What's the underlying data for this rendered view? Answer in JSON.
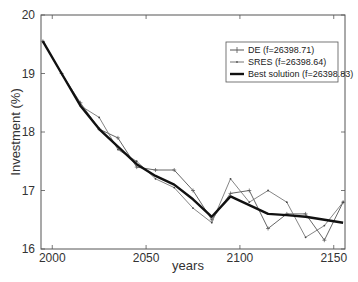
{
  "chart_data": {
    "type": "line",
    "title": "",
    "xlabel": "years",
    "ylabel": "Investment (%)",
    "xlim": [
      1994,
      2156
    ],
    "ylim": [
      16,
      20
    ],
    "xticks": [
      2000,
      2050,
      2100,
      2150
    ],
    "yticks": [
      16,
      17,
      18,
      19,
      20
    ],
    "grid": false,
    "legend_position": "upper right",
    "series": [
      {
        "name": "DE (f=26398.71)",
        "style": "thin line with + markers",
        "color": "#555555",
        "x": [
          1995,
          2005,
          2015,
          2025,
          2035,
          2045,
          2055,
          2065,
          2075,
          2085,
          2095,
          2105,
          2115,
          2125,
          2135,
          2145,
          2155
        ],
        "values": [
          19.55,
          19.0,
          18.5,
          18.05,
          17.9,
          17.4,
          17.35,
          17.35,
          17.0,
          16.5,
          16.95,
          17.0,
          16.35,
          16.6,
          16.6,
          16.15,
          16.8
        ]
      },
      {
        "name": "SRES (f=26398.64)",
        "style": "thin line with small markers",
        "color": "#777777",
        "x": [
          1995,
          2005,
          2015,
          2025,
          2035,
          2045,
          2055,
          2065,
          2075,
          2085,
          2095,
          2105,
          2115,
          2125,
          2135,
          2145,
          2155
        ],
        "values": [
          19.55,
          19.0,
          18.45,
          18.25,
          17.7,
          17.5,
          17.2,
          17.05,
          16.7,
          16.45,
          17.2,
          16.8,
          17.0,
          16.8,
          16.2,
          16.4,
          16.8
        ]
      },
      {
        "name": "Best solution (f=26398.83)",
        "style": "thick solid line",
        "color": "#111111",
        "x": [
          1995,
          2005,
          2015,
          2025,
          2035,
          2045,
          2055,
          2065,
          2075,
          2085,
          2095,
          2105,
          2115,
          2125,
          2135,
          2145,
          2155
        ],
        "values": [
          19.55,
          19.0,
          18.45,
          18.05,
          17.75,
          17.45,
          17.25,
          17.1,
          16.85,
          16.55,
          16.9,
          16.75,
          16.6,
          16.58,
          16.55,
          16.5,
          16.45
        ]
      }
    ]
  },
  "legend": {
    "items": [
      {
        "label": "DE (f=26398.71)"
      },
      {
        "label": "SRES (f=26398.64)"
      },
      {
        "label": "Best solution (f=26398.83)"
      }
    ]
  },
  "axes": {
    "xlabel": "years",
    "ylabel": "Investment (%)",
    "xtick_labels": [
      "2000",
      "2050",
      "2100",
      "2150"
    ],
    "ytick_labels": [
      "16",
      "17",
      "18",
      "19",
      "20"
    ]
  }
}
